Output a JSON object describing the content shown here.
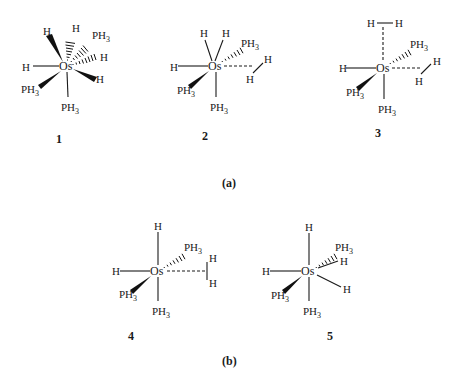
{
  "figure": {
    "panels": [
      {
        "label": "(a)",
        "structures": [
          "1",
          "2",
          "3"
        ]
      },
      {
        "label": "(b)",
        "structures": [
          "4",
          "5"
        ]
      }
    ],
    "center_atom": "Os",
    "structures": [
      {
        "id": "1",
        "label": "1",
        "ligands": {
          "h_wedge_topleft": "H",
          "h_hash_top": "H",
          "ph3_hash_topright": "PH",
          "h_hash_right": "H",
          "h_wedge_right": "H",
          "h_left": "H",
          "ph3_wedge_lowerleft": "PH",
          "ph3_bottom": "PH"
        }
      },
      {
        "id": "2",
        "label": "2",
        "ligands": {
          "h_top_a": "H",
          "h_top_b": "H",
          "ph3_hash_topright": "PH",
          "h_left": "H",
          "h2_a": "H",
          "h2_b": "H",
          "ph3_wedge_lowerleft": "PH",
          "ph3_bottom": "PH"
        }
      },
      {
        "id": "3",
        "label": "3",
        "ligands": {
          "h2_top_a": "H",
          "h2_top_b": "H",
          "ph3_hash_topright": "PH",
          "h_left": "H",
          "h2_a": "H",
          "h2_b": "H",
          "ph3_wedge_lowerleft": "PH",
          "ph3_bottom": "PH"
        }
      },
      {
        "id": "4",
        "label": "4",
        "ligands": {
          "h_top": "H",
          "ph3_hash_topright": "PH",
          "h_left": "H",
          "h2_a": "H",
          "h2_b": "H",
          "ph3_wedge_lowerleft": "PH",
          "ph3_bottom": "PH"
        }
      },
      {
        "id": "5",
        "label": "5",
        "ligands": {
          "h_top": "H",
          "ph3_hash_topright": "PH",
          "h_right": "H",
          "h_lowerright": "H",
          "h_left": "H",
          "ph3_wedge_lowerleft": "PH",
          "ph3_bottom": "PH"
        }
      }
    ],
    "ph3_subscript": "3"
  }
}
